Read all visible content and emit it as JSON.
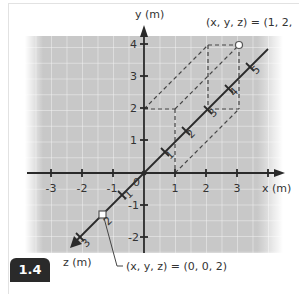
{
  "figure": {
    "number": "1.4",
    "axes": {
      "x_label": "x (m)",
      "y_label": "y (m)",
      "z_label": "z (m)",
      "x_ticks": [
        "-3",
        "-2",
        "-1",
        "1",
        "2",
        "3"
      ],
      "y_ticks": [
        "4",
        "3",
        "2",
        "1",
        "-1",
        "-2"
      ],
      "z_ticks": [
        "0",
        "-1",
        "2",
        "3"
      ],
      "z_ticks_positive_side": [
        "1",
        "2",
        "3",
        "4",
        "5"
      ],
      "origin_label": "0"
    },
    "points": [
      {
        "label": "(x, y, z) = (1, 2, -3)",
        "coords": [
          1,
          2,
          -3
        ],
        "marker": "circle"
      },
      {
        "label": "(x, y, z) = (0, 0, 2)",
        "coords": [
          0,
          0,
          2
        ],
        "marker": "square"
      }
    ],
    "colors": {
      "grid_bg": "#c8c8c8",
      "grid_line": "#ffffff",
      "axis": "#2a2a2a",
      "dashed": "#444444",
      "badge_bg": "#2a2a2a"
    }
  }
}
